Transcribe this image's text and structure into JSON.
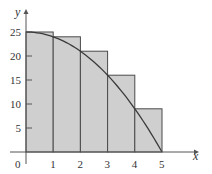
{
  "chart_data": {
    "type": "bar",
    "title": "",
    "xlabel": "x",
    "ylabel": "y",
    "xlim": [
      0,
      5
    ],
    "ylim": [
      0,
      25
    ],
    "x_ticks": [
      "0",
      "1",
      "2",
      "3",
      "4",
      "5"
    ],
    "y_ticks": [
      "5",
      "10",
      "15",
      "20",
      "25"
    ],
    "grid": false,
    "legend": null,
    "categories": [
      "[0,1]",
      "[1,2]",
      "[2,3]",
      "[3,4]",
      "[4,5]"
    ],
    "values": [
      25,
      24,
      21,
      16,
      9
    ],
    "curve": {
      "label": "y = 25 - x^2",
      "x": [
        0,
        0.5,
        1,
        1.5,
        2,
        2.5,
        3,
        3.5,
        4,
        4.5,
        5
      ],
      "y": [
        25,
        24.75,
        24,
        22.75,
        21,
        18.75,
        16,
        12.75,
        9,
        4.75,
        0
      ]
    }
  },
  "colors": {
    "fill": "#cfcfcf",
    "stroke": "#4a4a4a",
    "curve": "#3a3a3a",
    "axis": "#555555"
  }
}
